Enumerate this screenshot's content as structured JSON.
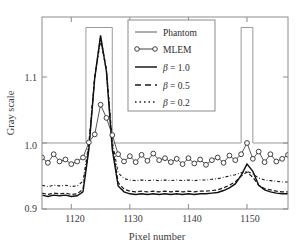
{
  "chart_data": {
    "type": "line",
    "title": "",
    "xlabel": "Pixel number",
    "ylabel": "Gray scale",
    "xlim": [
      1115,
      1157
    ],
    "ylim": [
      0.9,
      1.17
    ],
    "xticks": [
      1120,
      1130,
      1140,
      1150
    ],
    "yticks": [
      0.9,
      1.0,
      1.1
    ],
    "xtick_labels": [
      "1120",
      "1130",
      "1140",
      "1150"
    ],
    "ytick_labels": [
      "0.9",
      "1.0",
      "1.1"
    ],
    "grid": false,
    "legend_position": "top-center",
    "series": [
      {
        "name": "Phantom",
        "style": "solid-thin",
        "color": "#8a8a8a",
        "description": "Step profile: baseline 1.0, tall plateau 1122.5-1127 and 1149-1151 extending above axis top",
        "x": [
          1115,
          1122.5,
          1122.5,
          1127.0,
          1127.0,
          1149.0,
          1149.0,
          1151.0,
          1151.0,
          1157
        ],
        "values": [
          1.0,
          1.0,
          1.175,
          1.175,
          1.0,
          1.0,
          1.175,
          1.175,
          1.0,
          1.0
        ]
      },
      {
        "name": "MLEM",
        "style": "circle-markers",
        "color": "#3a3a3a",
        "x": [
          1115,
          1116,
          1117,
          1118,
          1119,
          1120,
          1121,
          1122,
          1123,
          1124,
          1125,
          1126,
          1127,
          1128,
          1129,
          1130,
          1131,
          1132,
          1133,
          1134,
          1135,
          1136,
          1137,
          1138,
          1139,
          1140,
          1141,
          1142,
          1143,
          1144,
          1145,
          1146,
          1147,
          1148,
          1149,
          1150,
          1151,
          1152,
          1153,
          1154,
          1155,
          1156,
          1157
        ],
        "values": [
          0.978,
          0.97,
          0.983,
          0.972,
          0.975,
          0.968,
          0.972,
          0.978,
          1.001,
          1.013,
          1.058,
          1.038,
          1.012,
          0.983,
          0.972,
          0.98,
          0.971,
          0.982,
          0.973,
          0.984,
          0.974,
          0.977,
          0.971,
          0.976,
          0.968,
          0.977,
          0.969,
          0.975,
          0.967,
          0.974,
          0.978,
          0.97,
          0.981,
          0.974,
          0.983,
          1.0,
          0.976,
          0.987,
          0.971,
          0.983,
          0.972,
          0.976,
          0.982
        ]
      },
      {
        "name": "β = 1.0",
        "style": "solid",
        "color": "#1a1a1a",
        "x": [
          1115,
          1116,
          1117,
          1118,
          1119,
          1120,
          1121,
          1122,
          1123,
          1124,
          1125,
          1126,
          1127,
          1128,
          1129,
          1130,
          1131,
          1132,
          1133,
          1134,
          1135,
          1136,
          1137,
          1138,
          1139,
          1140,
          1141,
          1142,
          1143,
          1144,
          1145,
          1146,
          1147,
          1148,
          1149,
          1150,
          1151,
          1152,
          1153,
          1154,
          1155,
          1156,
          1157
        ],
        "values": [
          0.921,
          0.919,
          0.921,
          0.92,
          0.921,
          0.919,
          0.92,
          0.926,
          0.99,
          1.098,
          1.163,
          1.108,
          0.99,
          0.935,
          0.926,
          0.923,
          0.922,
          0.923,
          0.922,
          0.923,
          0.922,
          0.923,
          0.922,
          0.923,
          0.922,
          0.923,
          0.922,
          0.923,
          0.923,
          0.924,
          0.925,
          0.928,
          0.932,
          0.938,
          0.951,
          0.968,
          0.957,
          0.936,
          0.929,
          0.926,
          0.924,
          0.923,
          0.923
        ]
      },
      {
        "name": "β = 0.5",
        "style": "dashed",
        "color": "#1a1a1a",
        "x": [
          1115,
          1116,
          1117,
          1118,
          1119,
          1120,
          1121,
          1122,
          1123,
          1124,
          1125,
          1126,
          1127,
          1128,
          1129,
          1130,
          1131,
          1132,
          1133,
          1134,
          1135,
          1136,
          1137,
          1138,
          1139,
          1140,
          1141,
          1142,
          1143,
          1144,
          1145,
          1146,
          1147,
          1148,
          1149,
          1150,
          1151,
          1152,
          1153,
          1154,
          1155,
          1156,
          1157
        ],
        "values": [
          0.924,
          0.922,
          0.924,
          0.923,
          0.924,
          0.922,
          0.923,
          0.93,
          0.995,
          1.1,
          1.16,
          1.11,
          0.996,
          0.94,
          0.93,
          0.927,
          0.926,
          0.927,
          0.926,
          0.927,
          0.926,
          0.927,
          0.926,
          0.927,
          0.926,
          0.927,
          0.926,
          0.927,
          0.927,
          0.928,
          0.929,
          0.932,
          0.936,
          0.941,
          0.95,
          0.956,
          0.948,
          0.936,
          0.931,
          0.929,
          0.927,
          0.926,
          0.926
        ]
      },
      {
        "name": "β = 0.2",
        "style": "dash-dot",
        "color": "#1a1a1a",
        "x": [
          1115,
          1116,
          1117,
          1118,
          1119,
          1120,
          1121,
          1122,
          1123,
          1124,
          1125,
          1126,
          1127,
          1128,
          1129,
          1130,
          1131,
          1132,
          1133,
          1134,
          1135,
          1136,
          1137,
          1138,
          1139,
          1140,
          1141,
          1142,
          1143,
          1144,
          1145,
          1146,
          1147,
          1148,
          1149,
          1150,
          1151,
          1152,
          1153,
          1154,
          1155,
          1156,
          1157
        ],
        "values": [
          0.936,
          0.934,
          0.936,
          0.935,
          0.936,
          0.934,
          0.935,
          0.942,
          1.0,
          1.1,
          1.155,
          1.112,
          1.002,
          0.955,
          0.946,
          0.944,
          0.943,
          0.944,
          0.943,
          0.944,
          0.943,
          0.944,
          0.943,
          0.944,
          0.943,
          0.944,
          0.943,
          0.944,
          0.944,
          0.945,
          0.946,
          0.948,
          0.95,
          0.952,
          0.955,
          0.957,
          0.953,
          0.947,
          0.944,
          0.943,
          0.942,
          0.941,
          0.941
        ]
      }
    ],
    "legend": [
      {
        "label": "Phantom",
        "style": "solid-thin"
      },
      {
        "label": "MLEM",
        "style": "circle-markers"
      },
      {
        "label": "β = 1.0",
        "style": "solid"
      },
      {
        "label": "β = 0.5",
        "style": "dashed"
      },
      {
        "label": "β = 0.2",
        "style": "dash-dot"
      }
    ]
  },
  "axes": {
    "xlabel": "Pixel number",
    "ylabel": "Gray scale",
    "xtick_labels": [
      "1120",
      "1130",
      "1140",
      "1150"
    ],
    "ytick_labels": [
      "1.1",
      "1.0",
      "0.9"
    ]
  },
  "legend_entries": [
    {
      "label": "Phantom"
    },
    {
      "label": "MLEM"
    },
    {
      "beta": "β",
      "eq": " = 1.0"
    },
    {
      "beta": "β",
      "eq": " = 0.5"
    },
    {
      "beta": "β",
      "eq": " = 0.2"
    }
  ],
  "colors": {
    "frame": "#8c8c8c",
    "phantom": "#9a9a9a",
    "data": "#262626",
    "text": "#3a3a3a",
    "background": "#ffffff"
  }
}
